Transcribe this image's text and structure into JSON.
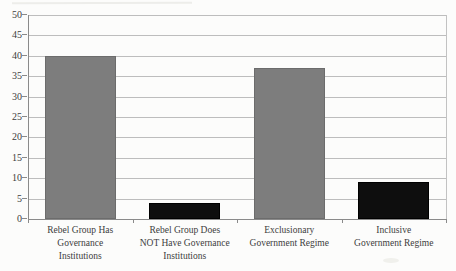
{
  "chart_data": {
    "type": "bar",
    "title": "",
    "xlabel": "",
    "ylabel": "",
    "categories": [
      [
        "Rebel Group Has",
        "Governance",
        "Institutions"
      ],
      [
        "Rebel Group Does",
        "NOT Have Governance",
        "Institutions"
      ],
      [
        "Exclusionary",
        "Government Regime"
      ],
      [
        "Inclusive",
        "Government Regime"
      ]
    ],
    "values": [
      40,
      4,
      37,
      9
    ],
    "bar_colors": [
      "#7d7d7d",
      "#0e0e0e",
      "#7d7d7d",
      "#0e0e0e"
    ],
    "bar_styles": [
      "gray",
      "black",
      "gray",
      "black"
    ],
    "ylim": [
      0,
      50
    ],
    "ytick_step": 5,
    "ytick_labels": [
      "0",
      "5",
      "10",
      "15",
      "20",
      "25",
      "30",
      "35",
      "40",
      "45",
      "50"
    ],
    "grid": true,
    "legend": "none",
    "colors": {
      "gridline": "#bdbdbd",
      "axis": "#8a8a8a",
      "text": "#3d3d3d",
      "background": "#fcfcfb"
    }
  }
}
